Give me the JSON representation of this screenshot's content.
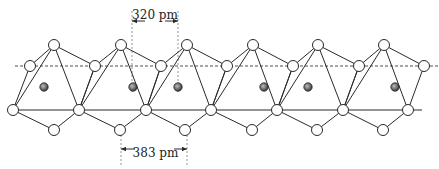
{
  "diagram": {
    "title": "",
    "dimensions": {
      "top": {
        "label": "320 pm",
        "x1": 132,
        "x2": 178,
        "y_text": 19,
        "y_arrow": 21,
        "y_start": 11,
        "y_end": 92
      },
      "bottom": {
        "label": "383 pm",
        "x1": 121,
        "x2": 187,
        "y_text": 157,
        "y_arrow": 149,
        "y_start": 135,
        "y_end": 165
      }
    },
    "reference_lines": {
      "dashed": {
        "x1": 15,
        "x2": 439,
        "y": 66
      },
      "solid": {
        "x1": 7,
        "x2": 422,
        "y": 110
      }
    },
    "colors": {
      "line": "#2a2a2a",
      "node_fill": "#ffffff",
      "atom_fill": "#6e6e6e"
    },
    "octahedra": [
      {
        "top": [
          54,
          45
        ],
        "dash_left": [
          30,
          66
        ],
        "dash_right": [
          95,
          66
        ],
        "solid_left": [
          13,
          110
        ],
        "solid_right": [
          79,
          110
        ],
        "bottom": [
          54,
          130
        ]
      },
      {
        "top": [
          121,
          45
        ],
        "dash_left": [
          95,
          66
        ],
        "dash_right": [
          161,
          66
        ],
        "solid_left": [
          79,
          110
        ],
        "solid_right": [
          146,
          110
        ],
        "bottom": [
          120,
          130
        ]
      },
      {
        "top": [
          187,
          45
        ],
        "dash_left": [
          161,
          66
        ],
        "dash_right": [
          227,
          66
        ],
        "solid_left": [
          146,
          110
        ],
        "solid_right": [
          211,
          110
        ],
        "bottom": [
          185,
          130
        ]
      },
      {
        "top": [
          253,
          45
        ],
        "dash_left": [
          227,
          66
        ],
        "dash_right": [
          293,
          66
        ],
        "solid_left": [
          211,
          110
        ],
        "solid_right": [
          277,
          110
        ],
        "bottom": [
          252,
          130
        ]
      },
      {
        "top": [
          318,
          45
        ],
        "dash_left": [
          293,
          66
        ],
        "dash_right": [
          359,
          66
        ],
        "solid_left": [
          277,
          110
        ],
        "solid_right": [
          343,
          110
        ],
        "bottom": [
          317,
          130
        ]
      },
      {
        "top": [
          384,
          45
        ],
        "dash_left": [
          359,
          66
        ],
        "dash_right": [
          424,
          66
        ],
        "solid_left": [
          343,
          110
        ],
        "solid_right": [
          408,
          110
        ],
        "bottom": [
          383,
          130
        ]
      }
    ],
    "metal_atoms": [
      [
        44,
        87
      ],
      [
        133,
        87
      ],
      [
        178,
        87
      ],
      [
        264,
        87
      ],
      [
        308,
        87
      ],
      [
        395,
        87
      ]
    ],
    "node_radius": 5.5,
    "atom_radius": 4.2
  }
}
